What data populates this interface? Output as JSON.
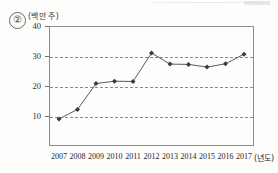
{
  "item": {
    "number": "②"
  },
  "axes": {
    "y_unit_label": "(백만 주)",
    "x_unit_label": "(년도)",
    "y_ticks": [
      "40",
      "30",
      "20",
      "10"
    ],
    "x_ticks": [
      "2007",
      "2008",
      "2009",
      "2010",
      "2011",
      "2012",
      "2013",
      "2014",
      "2015",
      "2016",
      "2017"
    ]
  },
  "style": {
    "line_color": "#5a5a5a",
    "marker_color": "#3a3a3a",
    "grid_color": "#8a8a8a",
    "frame_color": "#8c8c8c"
  },
  "chart_data": {
    "type": "line",
    "title": "",
    "xlabel": "(년도)",
    "ylabel": "(백만 주)",
    "categories": [
      "2007",
      "2008",
      "2009",
      "2010",
      "2011",
      "2012",
      "2013",
      "2014",
      "2015",
      "2016",
      "2017"
    ],
    "values": [
      9.0,
      12.2,
      20.8,
      21.6,
      21.5,
      31.0,
      27.3,
      27.2,
      26.3,
      27.4,
      30.6
    ],
    "ylim": [
      0,
      40
    ],
    "yticks": [
      10,
      20,
      30,
      40
    ],
    "gridlines": [
      10,
      20,
      30
    ],
    "grid": true,
    "legend": "none",
    "markers": true
  }
}
